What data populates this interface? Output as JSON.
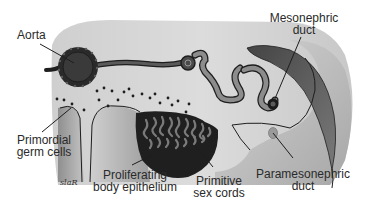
{
  "figure": {
    "colors": {
      "background": "#ffffff",
      "tissue_light": "#d6d6d6",
      "tissue_mid": "#b0b0b0",
      "dark_structure": "#2e2e2e",
      "duct_gray": "#8a8a8a",
      "outline": "#1e1e1e"
    }
  },
  "labels": {
    "aorta": "Aorta",
    "mesonephric_duct": [
      "Mesonephric",
      "duct"
    ],
    "primordial_germ_cells": [
      "Primordial",
      "germ cells"
    ],
    "proliferating_body_epithelium": [
      "Proliferating",
      "body epithelium"
    ],
    "primitive_sex_cords": [
      "Primitive",
      "sex cords"
    ],
    "paramesonephric_duct": [
      "Paramesonephric",
      "duct"
    ]
  },
  "signature": "slaR"
}
